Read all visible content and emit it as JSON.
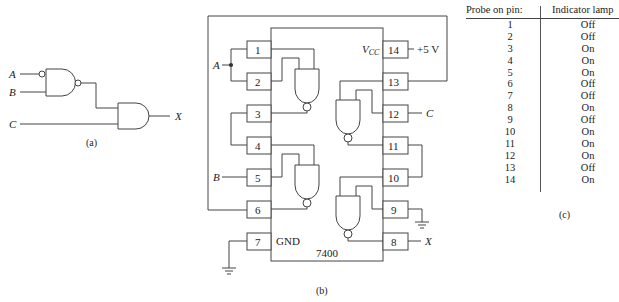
{
  "figure_a": {
    "inputs": [
      "A",
      "B",
      "C"
    ],
    "output": "X",
    "caption": "(a)",
    "gates": [
      {
        "type": "NAND",
        "inputs": [
          "A (inverted)",
          "B"
        ],
        "output_inverted": true
      },
      {
        "type": "AND",
        "inputs": [
          "NAND output",
          "C"
        ],
        "output": "X"
      }
    ]
  },
  "figure_b": {
    "chip": "7400",
    "vcc_label": "V",
    "vcc_sub": "CC",
    "gnd_label": "GND",
    "supply": "+5 V",
    "caption": "(b)",
    "left_pins": [
      "1",
      "2",
      "3",
      "4",
      "5",
      "6",
      "7"
    ],
    "right_pins": [
      "14",
      "13",
      "12",
      "11",
      "10",
      "9",
      "8"
    ],
    "signals": {
      "A": "A",
      "B": "B",
      "C": "C",
      "X": "X"
    }
  },
  "figure_c": {
    "caption": "(c)",
    "headers": {
      "pin": "Probe on pin:",
      "lamp": "Indicator lamp"
    },
    "rows": [
      {
        "pin": "1",
        "lamp": "Off"
      },
      {
        "pin": "2",
        "lamp": "Off"
      },
      {
        "pin": "3",
        "lamp": "On"
      },
      {
        "pin": "4",
        "lamp": "On"
      },
      {
        "pin": "5",
        "lamp": "On"
      },
      {
        "pin": "6",
        "lamp": "Off"
      },
      {
        "pin": "7",
        "lamp": "Off"
      },
      {
        "pin": "8",
        "lamp": "On"
      },
      {
        "pin": "9",
        "lamp": "Off"
      },
      {
        "pin": "10",
        "lamp": "On"
      },
      {
        "pin": "11",
        "lamp": "On"
      },
      {
        "pin": "12",
        "lamp": "On"
      },
      {
        "pin": "13",
        "lamp": "Off"
      },
      {
        "pin": "14",
        "lamp": "On"
      }
    ]
  }
}
